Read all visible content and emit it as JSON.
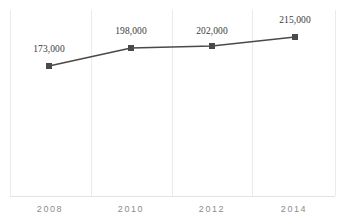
{
  "chart_data": {
    "type": "line",
    "title": "",
    "subtitle": "",
    "xlabel": "",
    "ylabel": "",
    "categories": [
      "2008",
      "2010",
      "2012",
      "2014"
    ],
    "values": [
      173000,
      198000,
      202000,
      215000
    ],
    "point_labels": [
      "173,000",
      "198,000",
      "202,000",
      "215,000"
    ],
    "series": [
      {
        "name": "",
        "values": [
          173000,
          198000,
          202000,
          215000
        ],
        "color": "#4a4a4a",
        "marker": "square"
      }
    ],
    "ylim": [
      0,
      240000
    ],
    "grid": {
      "vertical": true,
      "horizontal": false,
      "color": "#ebebeb"
    },
    "legend": {
      "visible": false,
      "position": "none"
    },
    "axis": {
      "x_axis_line": true,
      "y_axis_line": false,
      "axis_color": "#e2e2e2"
    },
    "data_labels_visible": true
  },
  "colors": {
    "line": "#4a4a4a",
    "marker": "#4a4a4a",
    "grid": "#ebebeb",
    "axis": "#e2e2e2",
    "label_text": "#3a3a3a",
    "tick_text": "#8c8c8c",
    "background": "#ffffff"
  },
  "geometry": {
    "gridline_x": [
      10,
      91,
      172,
      252,
      335
    ],
    "axis_y": 196,
    "grid_top_y": 10,
    "point_x": [
      49,
      131,
      212,
      295
    ],
    "point_y": [
      66,
      48,
      46,
      37
    ],
    "label_x": [
      49,
      131,
      212,
      295
    ],
    "label_y": [
      44,
      26,
      26,
      15
    ],
    "tick_x": [
      50,
      131,
      212,
      294
    ],
    "tick_y": 204
  }
}
